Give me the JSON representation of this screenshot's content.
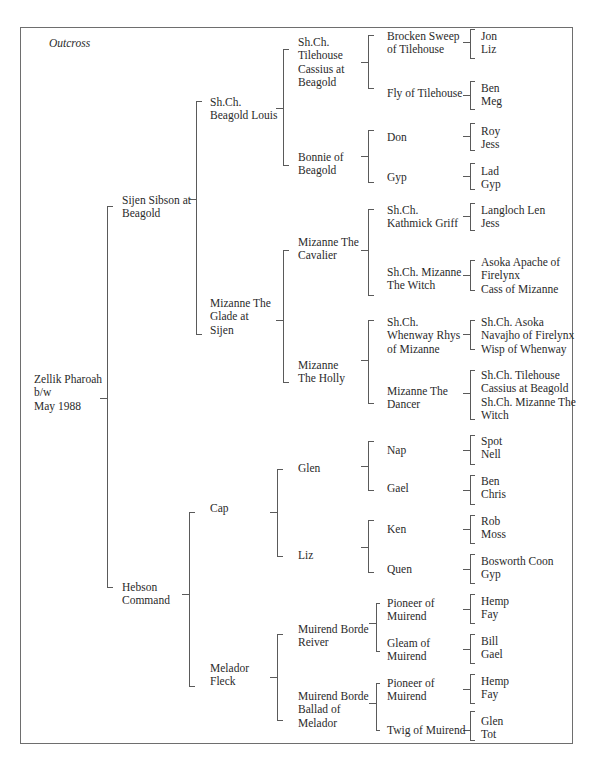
{
  "diagram": {
    "type": "pedigree",
    "caption": "Outcross",
    "line_color": "#5a5a5a",
    "text_color": "#2a2a2a"
  },
  "nodes": [
    {
      "id": "subject",
      "text": "Zellik Pharoah\nb/w\nMay 1988",
      "x": 34,
      "y": 373
    },
    {
      "id": "sire",
      "text": "Sijen Sibson at\nBeagold",
      "x": 122,
      "y": 194
    },
    {
      "id": "dam",
      "text": "Hebson\nCommand",
      "x": 122,
      "y": 581
    },
    {
      "id": "ss",
      "text": "Sh.Ch.\nBeagold Louis",
      "x": 210,
      "y": 96
    },
    {
      "id": "sd",
      "text": "Mizanne The\nGlade at\nSijen",
      "x": 210,
      "y": 297
    },
    {
      "id": "ds",
      "text": "Cap",
      "x": 210,
      "y": 502
    },
    {
      "id": "dd",
      "text": "Melador\nFleck",
      "x": 210,
      "y": 662
    },
    {
      "id": "sss",
      "text": "Sh.Ch.\nTilehouse\nCassius at\nBeagold",
      "x": 298,
      "y": 36
    },
    {
      "id": "ssd",
      "text": "Bonnie of\nBeagold",
      "x": 298,
      "y": 151
    },
    {
      "id": "sds",
      "text": "Mizanne The\nCavalier",
      "x": 298,
      "y": 236
    },
    {
      "id": "sdd",
      "text": "Mizanne\nThe Holly",
      "x": 298,
      "y": 359
    },
    {
      "id": "dss",
      "text": "Glen",
      "x": 298,
      "y": 462
    },
    {
      "id": "dsd",
      "text": "Liz",
      "x": 298,
      "y": 549
    },
    {
      "id": "dds",
      "text": "Muirend Borde\nReiver",
      "x": 298,
      "y": 623
    },
    {
      "id": "ddd",
      "text": "Muirend Borde\nBallad of\nMelador",
      "x": 298,
      "y": 690
    },
    {
      "id": "ssss",
      "text": "Brocken Sweep\nof Tilehouse",
      "x": 387,
      "y": 30
    },
    {
      "id": "sssd",
      "text": "Fly of Tilehouse",
      "x": 387,
      "y": 87
    },
    {
      "id": "ssds",
      "text": "Don",
      "x": 387,
      "y": 131
    },
    {
      "id": "ssdd",
      "text": "Gyp",
      "x": 387,
      "y": 171
    },
    {
      "id": "sdss",
      "text": "Sh.Ch.\nKathmick Griff",
      "x": 387,
      "y": 204
    },
    {
      "id": "sdsd",
      "text": "Sh.Ch. Mizanne\nThe Witch",
      "x": 387,
      "y": 266
    },
    {
      "id": "sdds",
      "text": "Sh.Ch.\nWhenway Rhys\nof Mizanne",
      "x": 387,
      "y": 316
    },
    {
      "id": "sddd",
      "text": "Mizanne The\nDancer",
      "x": 387,
      "y": 385
    },
    {
      "id": "dsss",
      "text": "Nap",
      "x": 387,
      "y": 444
    },
    {
      "id": "dssd",
      "text": "Gael",
      "x": 387,
      "y": 482
    },
    {
      "id": "dsds",
      "text": "Ken",
      "x": 387,
      "y": 523
    },
    {
      "id": "dsdd",
      "text": "Quen",
      "x": 387,
      "y": 563
    },
    {
      "id": "ddss",
      "text": "Pioneer of\nMuirend",
      "x": 387,
      "y": 597
    },
    {
      "id": "ddsd",
      "text": "Gleam of\nMuirend",
      "x": 387,
      "y": 637
    },
    {
      "id": "ddds",
      "text": "Pioneer of\nMuirend",
      "x": 387,
      "y": 677
    },
    {
      "id": "dddd",
      "text": "Twig of Muirend",
      "x": 387,
      "y": 724
    },
    {
      "id": "g4_01",
      "text": "Jon\nLiz",
      "x": 481,
      "y": 30
    },
    {
      "id": "g4_02",
      "text": "Ben\nMeg",
      "x": 481,
      "y": 82
    },
    {
      "id": "g4_03",
      "text": "Roy\nJess",
      "x": 481,
      "y": 125
    },
    {
      "id": "g4_04",
      "text": "Lad\nGyp",
      "x": 481,
      "y": 165
    },
    {
      "id": "g4_05",
      "text": "Langloch Len\nJess",
      "x": 481,
      "y": 204
    },
    {
      "id": "g4_06",
      "text": "Asoka Apache of\nFirelynx\nCass of Mizanne",
      "x": 481,
      "y": 256
    },
    {
      "id": "g4_07",
      "text": "Sh.Ch. Asoka\nNavajho of Firelynx\nWisp of Whenway",
      "x": 481,
      "y": 316
    },
    {
      "id": "g4_08",
      "text": "Sh.Ch. Tilehouse\nCassius at Beagold\nSh.Ch. Mizanne The\nWitch",
      "x": 481,
      "y": 369
    },
    {
      "id": "g4_09",
      "text": "Spot\nNell",
      "x": 481,
      "y": 435
    },
    {
      "id": "g4_10",
      "text": "Ben\nChris",
      "x": 481,
      "y": 475
    },
    {
      "id": "g4_11",
      "text": "Rob\nMoss",
      "x": 481,
      "y": 515
    },
    {
      "id": "g4_12",
      "text": "Bosworth Coon\nGyp",
      "x": 481,
      "y": 555
    },
    {
      "id": "g4_13",
      "text": "Hemp\nFay",
      "x": 481,
      "y": 595
    },
    {
      "id": "g4_14",
      "text": "Bill\nGael",
      "x": 481,
      "y": 635
    },
    {
      "id": "g4_15",
      "text": "Hemp\nFay",
      "x": 481,
      "y": 675
    },
    {
      "id": "g4_16",
      "text": "Glen\nTot",
      "x": 481,
      "y": 715
    }
  ],
  "brackets": [
    {
      "stub_x1": 100,
      "stub_y": 398,
      "x": 107,
      "y1": 206,
      "y2": 587,
      "tick": 6
    },
    {
      "stub_x1": 189,
      "stub_y": 199,
      "x": 196,
      "y1": 101,
      "y2": 334,
      "tick": 6
    },
    {
      "stub_x1": 182,
      "stub_y": 594,
      "x": 189,
      "y1": 512,
      "y2": 686,
      "tick": 6
    },
    {
      "stub_x1": 276,
      "stub_y": 108,
      "x": 283,
      "y1": 49,
      "y2": 165,
      "tick": 6
    },
    {
      "stub_x1": 276,
      "stub_y": 320,
      "x": 283,
      "y1": 250,
      "y2": 382,
      "tick": 6
    },
    {
      "stub_x1": 270,
      "stub_y": 512,
      "x": 277,
      "y1": 469,
      "y2": 556,
      "tick": 6
    },
    {
      "stub_x1": 270,
      "stub_y": 677,
      "x": 277,
      "y1": 634,
      "y2": 720,
      "tick": 6
    },
    {
      "stub_x1": 361,
      "stub_y": 62,
      "x": 368,
      "y1": 35,
      "y2": 88,
      "tick": 6
    },
    {
      "stub_x1": 361,
      "stub_y": 156,
      "x": 368,
      "y1": 130,
      "y2": 182,
      "tick": 6
    },
    {
      "stub_x1": 361,
      "stub_y": 250,
      "x": 368,
      "y1": 209,
      "y2": 295,
      "tick": 6
    },
    {
      "stub_x1": 361,
      "stub_y": 360,
      "x": 368,
      "y1": 320,
      "y2": 403,
      "tick": 6
    },
    {
      "stub_x1": 361,
      "stub_y": 466,
      "x": 368,
      "y1": 441,
      "y2": 490,
      "tick": 6
    },
    {
      "stub_x1": 361,
      "stub_y": 547,
      "x": 368,
      "y1": 520,
      "y2": 572,
      "tick": 6
    },
    {
      "stub_x1": 369,
      "stub_y": 623,
      "x": 376,
      "y1": 603,
      "y2": 651,
      "tick": 4
    },
    {
      "stub_x1": 369,
      "stub_y": 703,
      "x": 376,
      "y1": 683,
      "y2": 730,
      "tick": 4
    },
    {
      "stub_x1": 463,
      "stub_y": 42,
      "x": 470,
      "y1": 29,
      "y2": 58,
      "tick": 5
    },
    {
      "stub_x1": 463,
      "stub_y": 95,
      "x": 470,
      "y1": 81,
      "y2": 109,
      "tick": 5
    },
    {
      "stub_x1": 463,
      "stub_y": 136,
      "x": 470,
      "y1": 123,
      "y2": 150,
      "tick": 5
    },
    {
      "stub_x1": 463,
      "stub_y": 176,
      "x": 470,
      "y1": 163,
      "y2": 189,
      "tick": 5
    },
    {
      "stub_x1": 463,
      "stub_y": 216,
      "x": 470,
      "y1": 203,
      "y2": 230,
      "tick": 5
    },
    {
      "stub_x1": 463,
      "stub_y": 275,
      "x": 470,
      "y1": 260,
      "y2": 290,
      "tick": 5
    },
    {
      "stub_x1": 463,
      "stub_y": 334,
      "x": 470,
      "y1": 320,
      "y2": 349,
      "tick": 5
    },
    {
      "stub_x1": 463,
      "stub_y": 393,
      "x": 470,
      "y1": 370,
      "y2": 419,
      "tick": 5
    },
    {
      "stub_x1": 463,
      "stub_y": 450,
      "x": 470,
      "y1": 435,
      "y2": 464,
      "tick": 5
    },
    {
      "stub_x1": 463,
      "stub_y": 490,
      "x": 470,
      "y1": 475,
      "y2": 504,
      "tick": 5
    },
    {
      "stub_x1": 463,
      "stub_y": 529,
      "x": 470,
      "y1": 515,
      "y2": 543,
      "tick": 5
    },
    {
      "stub_x1": 463,
      "stub_y": 569,
      "x": 470,
      "y1": 554,
      "y2": 583,
      "tick": 5
    },
    {
      "stub_x1": 463,
      "stub_y": 609,
      "x": 470,
      "y1": 594,
      "y2": 623,
      "tick": 5
    },
    {
      "stub_x1": 463,
      "stub_y": 649,
      "x": 470,
      "y1": 634,
      "y2": 663,
      "tick": 5
    },
    {
      "stub_x1": 463,
      "stub_y": 689,
      "x": 470,
      "y1": 674,
      "y2": 703,
      "tick": 5
    },
    {
      "stub_x1": 463,
      "stub_y": 730,
      "x": 470,
      "y1": 711,
      "y2": 740,
      "tick": 5
    }
  ]
}
